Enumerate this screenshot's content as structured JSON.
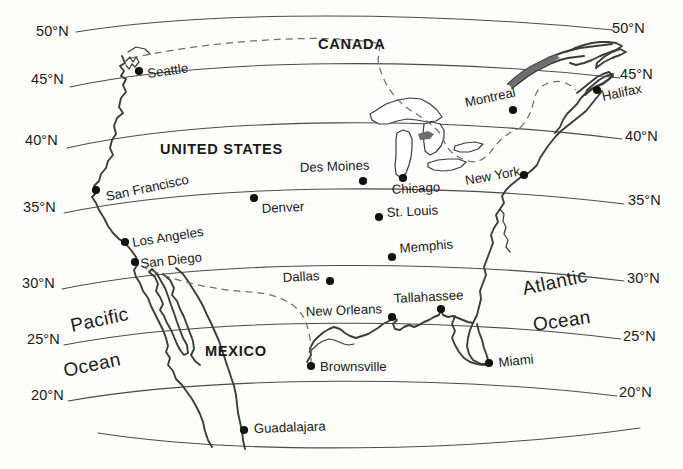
{
  "map": {
    "title": "Reference map of North America with latitude lines",
    "background_color": "#fdfdfc",
    "line_color": "#4a4a4a",
    "coast_color": "#3c3c3c",
    "border_color": "#6d6d6d",
    "text_color": "#1a1a1a",
    "width": 683,
    "height": 469
  },
  "latitude_labels_left": [
    {
      "text": "50°N",
      "x": 36,
      "y": 36
    },
    {
      "text": "45°N",
      "x": 31,
      "y": 84
    },
    {
      "text": "40°N",
      "x": 25,
      "y": 145
    },
    {
      "text": "35°N",
      "x": 23,
      "y": 212
    },
    {
      "text": "30°N",
      "x": 22,
      "y": 288
    },
    {
      "text": "25°N",
      "x": 27,
      "y": 344
    },
    {
      "text": "20°N",
      "x": 31,
      "y": 400
    }
  ],
  "latitude_labels_right": [
    {
      "text": "50°N",
      "x": 612,
      "y": 33
    },
    {
      "text": "45°N",
      "x": 620,
      "y": 79
    },
    {
      "text": "40°N",
      "x": 625,
      "y": 141
    },
    {
      "text": "35°N",
      "x": 628,
      "y": 205
    },
    {
      "text": "30°N",
      "x": 627,
      "y": 283
    },
    {
      "text": "25°N",
      "x": 623,
      "y": 341
    },
    {
      "text": "20°N",
      "x": 619,
      "y": 397
    }
  ],
  "countries": [
    {
      "name": "CANADA",
      "x": 318,
      "y": 49,
      "rotation": 0
    },
    {
      "name": "UNITED STATES",
      "x": 160,
      "y": 154,
      "rotation": 0
    },
    {
      "name": "MEXICO",
      "x": 205,
      "y": 356,
      "rotation": 0
    }
  ],
  "oceans": [
    {
      "name": "Pacific",
      "x": 72,
      "y": 332,
      "rotation": -12
    },
    {
      "name": "Ocean",
      "x": 65,
      "y": 377,
      "rotation": -12
    },
    {
      "name": "Atlantic",
      "x": 524,
      "y": 295,
      "rotation": -12
    },
    {
      "name": "Ocean",
      "x": 534,
      "y": 331,
      "rotation": -8
    }
  ],
  "cities": [
    {
      "name": "Seattle",
      "dot_x": 139,
      "dot_y": 71,
      "label_x": 148,
      "label_y": 78,
      "rotation": -8,
      "anchor": "start"
    },
    {
      "name": "San Francisco",
      "dot_x": 96,
      "dot_y": 190,
      "label_x": 107,
      "label_y": 201,
      "rotation": -12,
      "anchor": "start"
    },
    {
      "name": "Los Angeles",
      "dot_x": 125,
      "dot_y": 242,
      "label_x": 133,
      "label_y": 247,
      "rotation": -9,
      "anchor": "start"
    },
    {
      "name": "San Diego",
      "dot_x": 135,
      "dot_y": 262,
      "label_x": 141,
      "label_y": 268,
      "rotation": -6,
      "anchor": "start"
    },
    {
      "name": "Denver",
      "dot_x": 254,
      "dot_y": 198,
      "label_x": 262,
      "label_y": 213,
      "rotation": -3,
      "anchor": "start"
    },
    {
      "name": "Des Moines",
      "dot_x": 363,
      "dot_y": 181,
      "label_x": 300,
      "label_y": 172,
      "rotation": -2,
      "anchor": "start"
    },
    {
      "name": "Chicago",
      "dot_x": 403,
      "dot_y": 178,
      "label_x": 392,
      "label_y": 194,
      "rotation": -3,
      "anchor": "start"
    },
    {
      "name": "St. Louis",
      "dot_x": 379,
      "dot_y": 217,
      "label_x": 387,
      "label_y": 217,
      "rotation": -3,
      "anchor": "start"
    },
    {
      "name": "Memphis",
      "dot_x": 392,
      "dot_y": 257,
      "label_x": 400,
      "label_y": 253,
      "rotation": -5,
      "anchor": "start"
    },
    {
      "name": "Dallas",
      "dot_x": 330,
      "dot_y": 281,
      "label_x": 283,
      "label_y": 282,
      "rotation": -3,
      "anchor": "start"
    },
    {
      "name": "New Orleans",
      "dot_x": 392,
      "dot_y": 317,
      "label_x": 306,
      "label_y": 316,
      "rotation": -2,
      "anchor": "start"
    },
    {
      "name": "Brownsville",
      "dot_x": 311,
      "dot_y": 366,
      "label_x": 320,
      "label_y": 371,
      "rotation": 0,
      "anchor": "start"
    },
    {
      "name": "Guadalajara",
      "dot_x": 244,
      "dot_y": 430,
      "label_x": 254,
      "label_y": 433,
      "rotation": -2,
      "anchor": "start"
    },
    {
      "name": "Tallahassee",
      "dot_x": 441,
      "dot_y": 309,
      "label_x": 394,
      "label_y": 303,
      "rotation": -3,
      "anchor": "start"
    },
    {
      "name": "Miami",
      "dot_x": 489,
      "dot_y": 363,
      "label_x": 499,
      "label_y": 367,
      "rotation": -6,
      "anchor": "start"
    },
    {
      "name": "New York",
      "dot_x": 524,
      "dot_y": 175,
      "label_x": 466,
      "label_y": 185,
      "rotation": -10,
      "anchor": "start"
    },
    {
      "name": "Montreal",
      "dot_x": 513,
      "dot_y": 110,
      "label_x": 466,
      "label_y": 107,
      "rotation": -12,
      "anchor": "start"
    },
    {
      "name": "Halifax",
      "dot_x": 597,
      "dot_y": 90,
      "label_x": 603,
      "label_y": 101,
      "rotation": -12,
      "anchor": "start"
    }
  ]
}
